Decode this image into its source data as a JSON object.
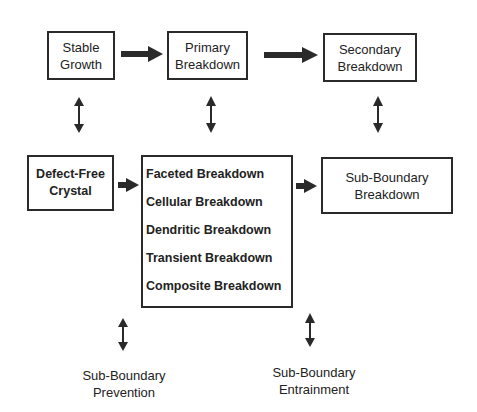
{
  "diagram": {
    "nodes": {
      "stable_growth": {
        "lines": [
          "Stable",
          "Growth"
        ]
      },
      "primary_breakdown": {
        "lines": [
          "Primary",
          "Breakdown"
        ]
      },
      "secondary_breakdown": {
        "lines": [
          "Secondary",
          "Breakdown"
        ]
      },
      "defect_free_crystal": {
        "lines": [
          "Defect-Free",
          "Crystal"
        ]
      },
      "breakdown_types": {
        "lines": [
          "Faceted Breakdown",
          "Cellular Breakdown",
          "Dendritic Breakdown",
          "Transient Breakdown",
          "Composite Breakdown"
        ]
      },
      "sub_boundary_breakdown": {
        "lines": [
          "Sub-Boundary",
          "Breakdown"
        ]
      },
      "sub_boundary_prevention": {
        "lines": [
          "Sub-Boundary",
          "Prevention"
        ]
      },
      "sub_boundary_entrainment": {
        "lines": [
          "Sub-Boundary",
          "Entrainment"
        ]
      }
    },
    "edges": [
      {
        "from": "stable_growth",
        "to": "primary_breakdown",
        "type": "bold-right-arrow"
      },
      {
        "from": "primary_breakdown",
        "to": "secondary_breakdown",
        "type": "bold-right-arrow"
      },
      {
        "from": "defect_free_crystal",
        "to": "breakdown_types",
        "type": "bold-right-arrow"
      },
      {
        "from": "breakdown_types",
        "to": "sub_boundary_breakdown",
        "type": "bold-right-arrow"
      },
      {
        "from": "stable_growth",
        "to": "defect_free_crystal",
        "type": "double-vertical-arrow"
      },
      {
        "from": "primary_breakdown",
        "to": "breakdown_types",
        "type": "double-vertical-arrow"
      },
      {
        "from": "secondary_breakdown",
        "to": "sub_boundary_breakdown",
        "type": "double-vertical-arrow"
      },
      {
        "from": "sub_boundary_prevention",
        "to": "breakdown_types",
        "type": "double-vertical-arrow"
      },
      {
        "from": "sub_boundary_entrainment",
        "to": "breakdown_types",
        "type": "double-vertical-arrow"
      }
    ],
    "colors": {
      "line": "#2a2a2a",
      "background": "#ffffff"
    }
  }
}
